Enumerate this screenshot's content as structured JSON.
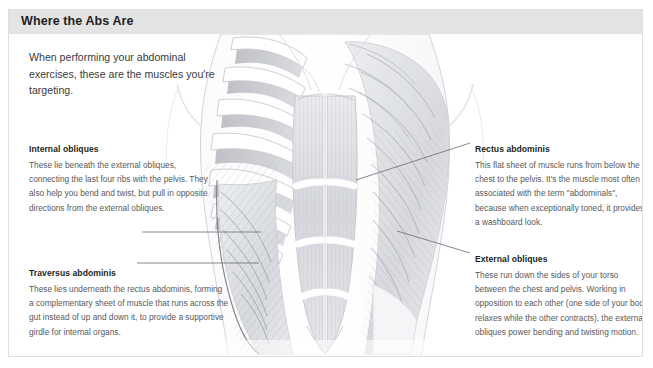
{
  "panel": {
    "title": "Where the Abs Are",
    "header_bg": "#e4e4e4",
    "border_color": "#dedede",
    "background": "#ffffff"
  },
  "intro": {
    "text": "When performing your abdominal exercises, these are the muscles you're targeting."
  },
  "labels": {
    "internal_obliques": {
      "heading": "Internal obliques",
      "body": "These lie beneath the external obliques, connecting the last four ribs with the pelvis. They also help you bend and twist, but pull in opposite directions from the external obliques."
    },
    "traversus_abdominis": {
      "heading": "Traversus abdominis",
      "body": "These lies underneath the rectus abdominis, forming a complementary sheet of muscle that runs across the gut instead of up and down it, to provide a supportive girdle for internal organs."
    },
    "rectus_abdominis": {
      "heading": "Rectus abdominis",
      "body": "This flat sheet of muscle runs from below the chest to the pelvis. It's the muscle most often associated with the term \"abdominals\", because when exceptionally toned, it provides a washboard look."
    },
    "external_obliques": {
      "heading": "External obliques",
      "body": "These run down the sides of your torso between the chest and pelvis. Working in opposition to each other (one side of your body relaxes while the other contracts), the external obliques power bending and twisting motion."
    }
  },
  "illustration": {
    "name": "abdominal-muscles-anatomy-drawing",
    "style": "pencil-sketch",
    "line_color": "#6f7072",
    "muscle_tone": "#d9dade",
    "bone_tone": "#fdfdfd"
  },
  "leader_lines": [
    {
      "name": "leader-line-internal-obliques",
      "from": [
        133,
        222
      ],
      "to": [
        252,
        222
      ]
    },
    {
      "name": "leader-line-traversus-abdominis",
      "from": [
        128,
        262
      ],
      "to": [
        250,
        262
      ]
    },
    {
      "name": "leader-line-rectus-abdominis",
      "from": [
        347,
        179
      ],
      "to": [
        463,
        142
      ]
    },
    {
      "name": "leader-line-external-obliques",
      "from": [
        388,
        230
      ],
      "to": [
        462,
        252
      ]
    }
  ]
}
